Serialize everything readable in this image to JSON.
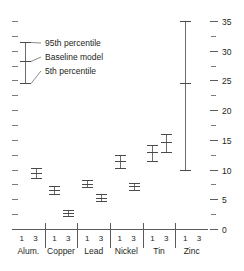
{
  "chart_data": {
    "type": "line",
    "title": "",
    "xlabel": "",
    "ylabel": "",
    "ylim": [
      0,
      35
    ],
    "grid": false,
    "legend_position": "upper-left",
    "y_ticks": [
      0,
      5,
      10,
      15,
      20,
      25,
      30,
      35
    ],
    "y_tick_labels": [
      "0",
      "5",
      "10",
      "15",
      "20",
      "25",
      "30",
      "35"
    ],
    "y_minor_ticks": [
      2.5,
      7.5,
      12.5,
      17.5,
      22.5,
      27.5,
      32.5
    ],
    "groups": [
      "Alum.",
      "Copper",
      "Lead",
      "Nickel",
      "Tin",
      "Zinc"
    ],
    "sub_categories": [
      "1",
      "3"
    ],
    "legend": [
      "95th percentile",
      "Baseline model",
      "5th percentile"
    ],
    "series": [
      {
        "name": "95th percentile",
        "values": [
          null,
          10.3,
          7.2,
          3.2,
          8.2,
          5.9,
          12.4,
          7.8,
          14.2,
          16.0,
          35.0,
          null
        ]
      },
      {
        "name": "Baseline model",
        "values": [
          null,
          9.5,
          6.6,
          2.7,
          7.6,
          5.3,
          11.4,
          7.2,
          13.0,
          14.6,
          24.5,
          null
        ]
      },
      {
        "name": "5th percentile",
        "values": [
          null,
          8.6,
          5.9,
          2.2,
          7.0,
          4.7,
          10.3,
          6.6,
          11.4,
          13.0,
          10.0,
          null
        ]
      }
    ],
    "points": [
      {
        "group": "Alum.",
        "sub": "1",
        "p5": null,
        "baseline": null,
        "p95": null
      },
      {
        "group": "Alum.",
        "sub": "3",
        "p5": 8.6,
        "baseline": 9.5,
        "p95": 10.3
      },
      {
        "group": "Copper",
        "sub": "1",
        "p5": 5.9,
        "baseline": 6.6,
        "p95": 7.2
      },
      {
        "group": "Copper",
        "sub": "3",
        "p5": 2.2,
        "baseline": 2.7,
        "p95": 3.2
      },
      {
        "group": "Lead",
        "sub": "1",
        "p5": 7.0,
        "baseline": 7.6,
        "p95": 8.2
      },
      {
        "group": "Lead",
        "sub": "3",
        "p5": 4.7,
        "baseline": 5.3,
        "p95": 5.9
      },
      {
        "group": "Nickel",
        "sub": "1",
        "p5": 10.3,
        "baseline": 11.4,
        "p95": 12.4
      },
      {
        "group": "Nickel",
        "sub": "3",
        "p5": 6.6,
        "baseline": 7.2,
        "p95": 7.8
      },
      {
        "group": "Tin",
        "sub": "1",
        "p5": 11.4,
        "baseline": 13.0,
        "p95": 14.2
      },
      {
        "group": "Tin",
        "sub": "3",
        "p5": 13.0,
        "baseline": 14.6,
        "p95": 16.0
      },
      {
        "group": "Zinc",
        "sub": "1",
        "p5": 10.0,
        "baseline": 24.5,
        "p95": 35.0
      },
      {
        "group": "Zinc",
        "sub": "3",
        "p5": null,
        "baseline": null,
        "p95": null
      }
    ],
    "legend_sample": {
      "p5": 24.5,
      "baseline": 28.2,
      "p95": 31.5
    },
    "colors": {
      "marker": "#4a4a4a",
      "stem": "#6d6d6d",
      "axis": "#5b5b5b",
      "text": "#231f20",
      "background": "#ffffff"
    }
  }
}
